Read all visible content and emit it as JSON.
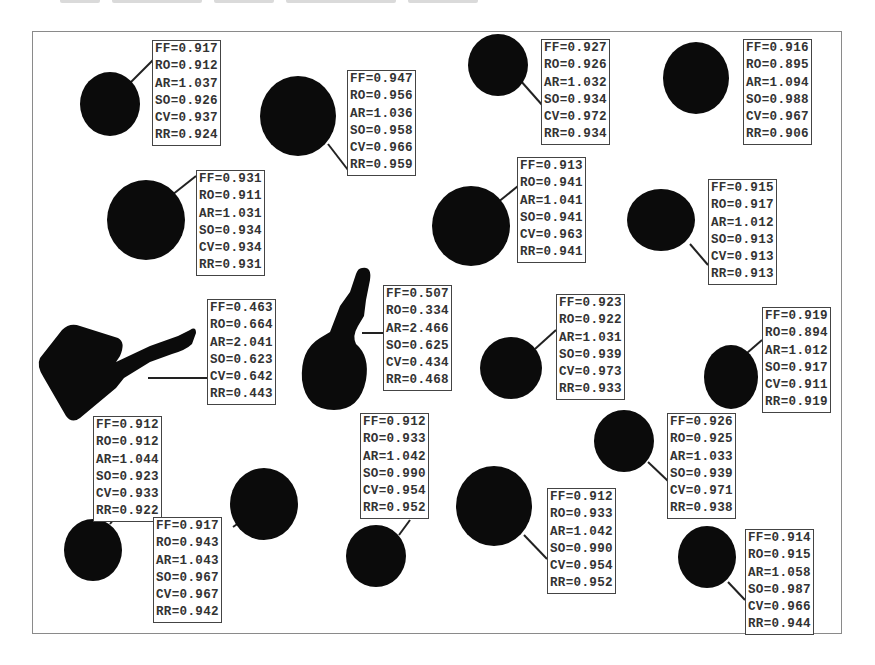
{
  "figure": {
    "metrics_legend": [
      "FF",
      "RO",
      "AR",
      "SO",
      "CV",
      "RR"
    ],
    "particles": [
      {
        "id": "p1",
        "shape": "round",
        "FF": "0.917",
        "RO": "0.912",
        "AR": "1.037",
        "SO": "0.926",
        "CV": "0.937",
        "RR": "0.924"
      },
      {
        "id": "p2",
        "shape": "round",
        "FF": "0.947",
        "RO": "0.956",
        "AR": "1.036",
        "SO": "0.958",
        "CV": "0.966",
        "RR": "0.959"
      },
      {
        "id": "p3",
        "shape": "round",
        "FF": "0.927",
        "RO": "0.926",
        "AR": "1.032",
        "SO": "0.934",
        "CV": "0.972",
        "RR": "0.934"
      },
      {
        "id": "p4",
        "shape": "round",
        "FF": "0.916",
        "RO": "0.895",
        "AR": "1.094",
        "SO": "0.988",
        "CV": "0.967",
        "RR": "0.906"
      },
      {
        "id": "p5",
        "shape": "round",
        "FF": "0.931",
        "RO": "0.911",
        "AR": "1.031",
        "SO": "0.934",
        "CV": "0.934",
        "RR": "0.931"
      },
      {
        "id": "p6",
        "shape": "round",
        "FF": "0.913",
        "RO": "0.941",
        "AR": "1.041",
        "SO": "0.941",
        "CV": "0.963",
        "RR": "0.941"
      },
      {
        "id": "p7",
        "shape": "round",
        "FF": "0.915",
        "RO": "0.917",
        "AR": "1.012",
        "SO": "0.913",
        "CV": "0.913",
        "RR": "0.913"
      },
      {
        "id": "p8",
        "shape": "irregular-block",
        "FF": "0.463",
        "RO": "0.664",
        "AR": "2.041",
        "SO": "0.623",
        "CV": "0.642",
        "RR": "0.443"
      },
      {
        "id": "p9",
        "shape": "irregular-keyhole",
        "FF": "0.507",
        "RO": "0.334",
        "AR": "2.466",
        "SO": "0.625",
        "CV": "0.434",
        "RR": "0.468"
      },
      {
        "id": "p10",
        "shape": "round",
        "FF": "0.923",
        "RO": "0.922",
        "AR": "1.031",
        "SO": "0.939",
        "CV": "0.973",
        "RR": "0.933"
      },
      {
        "id": "p11",
        "shape": "round",
        "FF": "0.919",
        "RO": "0.894",
        "AR": "1.012",
        "SO": "0.917",
        "CV": "0.911",
        "RR": "0.919"
      },
      {
        "id": "p12",
        "shape": "round",
        "FF": "0.912",
        "RO": "0.912",
        "AR": "1.044",
        "SO": "0.923",
        "CV": "0.933",
        "RR": "0.922"
      },
      {
        "id": "p13",
        "shape": "round",
        "FF": "0.917",
        "RO": "0.943",
        "AR": "1.043",
        "SO": "0.967",
        "CV": "0.967",
        "RR": "0.942"
      },
      {
        "id": "p14",
        "shape": "round",
        "FF": "0.912",
        "RO": "0.933",
        "AR": "1.042",
        "SO": "0.990",
        "CV": "0.954",
        "RR": "0.952"
      },
      {
        "id": "p15",
        "shape": "round",
        "FF": "0.912",
        "RO": "0.933",
        "AR": "1.042",
        "SO": "0.990",
        "CV": "0.954",
        "RR": "0.952"
      },
      {
        "id": "p16",
        "shape": "round",
        "FF": "0.926",
        "RO": "0.925",
        "AR": "1.033",
        "SO": "0.939",
        "CV": "0.971",
        "RR": "0.938"
      },
      {
        "id": "p17",
        "shape": "round",
        "FF": "0.914",
        "RO": "0.915",
        "AR": "1.058",
        "SO": "0.987",
        "CV": "0.966",
        "RR": "0.944"
      }
    ]
  },
  "colors": {
    "particle": "#0b0b0b",
    "label_border": "#444444",
    "frame": "#8a8a8a",
    "text": "#333333"
  }
}
